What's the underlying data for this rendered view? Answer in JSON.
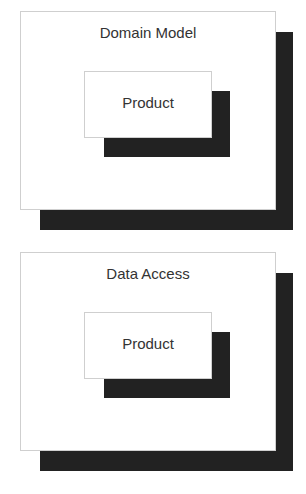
{
  "diagram": {
    "colors": {
      "shadow": "#222222",
      "box_fill": "#ffffff",
      "box_border": "#cfcfcf",
      "text": "#333333"
    },
    "layers": [
      {
        "title": "Domain Model",
        "inner": {
          "label": "Product"
        }
      },
      {
        "title": "Data Access",
        "inner": {
          "label": "Product"
        }
      }
    ]
  }
}
